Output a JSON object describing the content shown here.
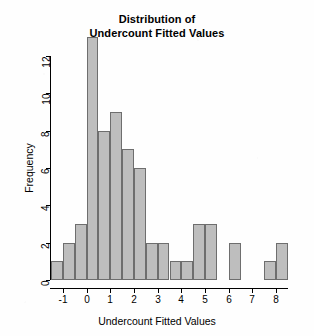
{
  "chart_data": {
    "type": "bar",
    "title": "Distribution of Undercount Fitted Values",
    "title_line1": "Distribution of",
    "title_line2": "Undercount Fitted Values",
    "xlabel": "Undercount Fitted Values",
    "ylabel": "Frequency",
    "grid": false,
    "legend": "none",
    "bin_width": 0.5,
    "xlim": [
      -1.5,
      8.5
    ],
    "ylim": [
      0,
      13
    ],
    "xticks": [
      -1,
      0,
      1,
      2,
      3,
      4,
      5,
      6,
      7,
      8
    ],
    "xtick_labels": [
      "-1",
      "0",
      "1",
      "2",
      "3",
      "4",
      "5",
      "6",
      "7",
      "8"
    ],
    "yticks": [
      0,
      2,
      4,
      6,
      8,
      10,
      12
    ],
    "ytick_labels": [
      "0",
      "2",
      "4",
      "6",
      "8",
      "10",
      "12"
    ],
    "bin_edges": [
      -1.5,
      -1.0,
      -0.5,
      0.0,
      0.5,
      1.0,
      1.5,
      2.0,
      2.5,
      3.0,
      3.5,
      4.0,
      4.5,
      5.0,
      5.5,
      6.0,
      6.5,
      7.0,
      7.5,
      8.0,
      8.5
    ],
    "categories": [
      "-1.5 to -1.0",
      "-1.0 to -0.5",
      "-0.5 to 0.0",
      "0.0 to 0.5",
      "0.5 to 1.0",
      "1.0 to 1.5",
      "1.5 to 2.0",
      "2.0 to 2.5",
      "2.5 to 3.0",
      "3.0 to 3.5",
      "3.5 to 4.0",
      "4.0 to 4.5",
      "4.5 to 5.0",
      "5.0 to 5.5",
      "5.5 to 6.0",
      "6.0 to 6.5",
      "6.5 to 7.0",
      "7.0 to 7.5",
      "7.5 to 8.0",
      "8.0 to 8.5"
    ],
    "values": [
      1,
      2,
      3,
      13,
      8,
      9,
      7,
      6,
      2,
      2,
      1,
      1,
      3,
      3,
      0,
      2,
      0,
      0,
      1,
      2
    ],
    "bar_fill_color": "#bebebe",
    "bar_border_color": "#6e6e6e",
    "background_color": "#fefefe",
    "axis_color": "#000000"
  }
}
